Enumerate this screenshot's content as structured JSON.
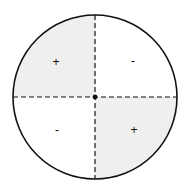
{
  "diagram": {
    "title": "",
    "colors": {
      "outline": "#111111",
      "shaded": "#efefef",
      "background": "#ffffff"
    },
    "quadrants": [
      {
        "position": "top-left",
        "sign": "+",
        "shaded": true
      },
      {
        "position": "top-right",
        "sign": "-",
        "shaded": false
      },
      {
        "position": "bottom-left",
        "sign": "-",
        "shaded": false
      },
      {
        "position": "bottom-right",
        "sign": "+",
        "shaded": true
      }
    ],
    "axes": {
      "style": "dashed",
      "center_marker": "dot"
    }
  }
}
